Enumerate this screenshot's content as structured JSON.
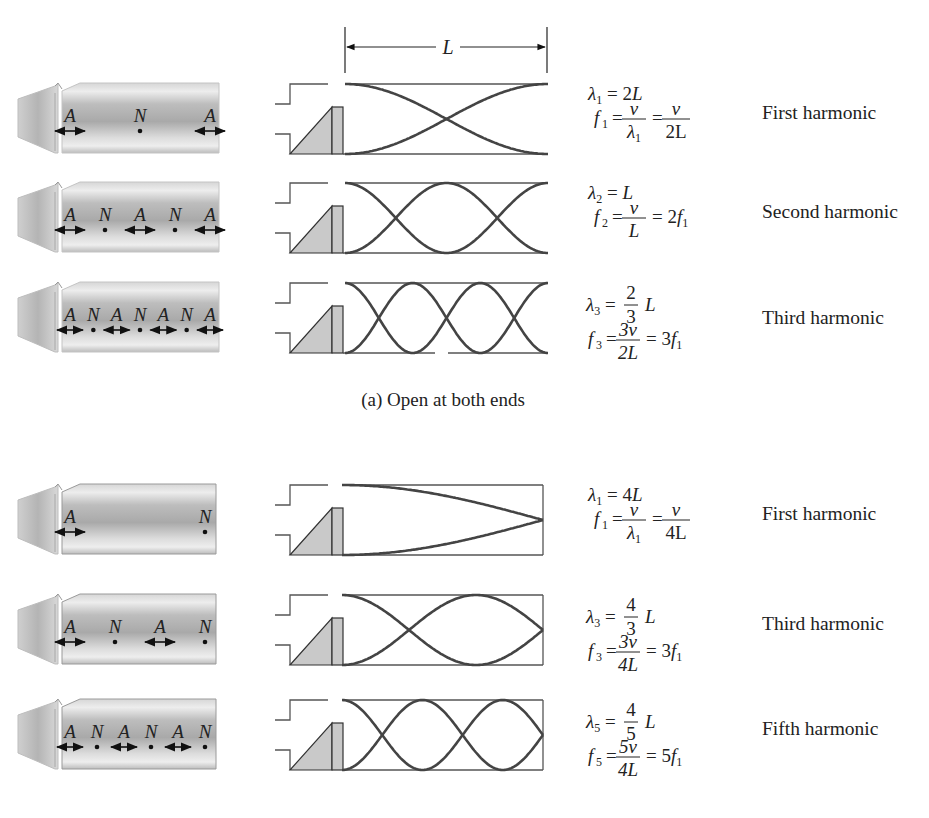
{
  "figure": {
    "dimension_label": "L",
    "colors": {
      "wave_line": "#444444",
      "box_line": "#555555",
      "shade_fill": "#c9c9c9",
      "pipe_light": "#e6e6e6",
      "pipe_dark": "#a8a8a8",
      "text": "#222222"
    }
  },
  "sections": [
    {
      "id": "open-both-ends",
      "caption": "(a) Open at both ends",
      "rows": [
        {
          "harmonic_name": "First harmonic",
          "pipe_markers": [
            "A",
            "N",
            "A"
          ],
          "wavelength": {
            "symbol": "λ",
            "sub": "1",
            "rhs": "= 2L"
          },
          "frequency": {
            "symbol": "f",
            "sub": "1",
            "frac1_num": "v",
            "frac1_den": "λ",
            "frac1_den_sub": "1",
            "frac2_num": "v",
            "frac2_den": "2L"
          },
          "wave": {
            "type": "open",
            "half_waves": 1
          }
        },
        {
          "harmonic_name": "Second harmonic",
          "pipe_markers": [
            "A",
            "N",
            "A",
            "N",
            "A"
          ],
          "wavelength": {
            "symbol": "λ",
            "sub": "2",
            "rhs": "= L"
          },
          "frequency": {
            "symbol": "f",
            "sub": "2",
            "frac1_num": "v",
            "frac1_den": "L",
            "rhs": "= 2f",
            "rhs_sub": "1"
          },
          "wave": {
            "type": "open",
            "half_waves": 2
          }
        },
        {
          "harmonic_name": "Third harmonic",
          "pipe_markers": [
            "A",
            "N",
            "A",
            "N",
            "A",
            "N",
            "A"
          ],
          "wavelength": {
            "symbol": "λ",
            "sub": "3",
            "frac_num": "2",
            "frac_den": "3",
            "rhs": "L"
          },
          "frequency": {
            "symbol": "f",
            "sub": "3",
            "frac1_num": "3v",
            "frac1_den": "2L",
            "rhs": "= 3f",
            "rhs_sub": "1"
          },
          "wave": {
            "type": "open",
            "half_waves": 3
          }
        }
      ]
    },
    {
      "id": "closed-one-end",
      "caption": "",
      "rows": [
        {
          "harmonic_name": "First harmonic",
          "pipe_markers": [
            "A",
            "N"
          ],
          "wavelength": {
            "symbol": "λ",
            "sub": "1",
            "rhs": "= 4L"
          },
          "frequency": {
            "symbol": "f",
            "sub": "1",
            "frac1_num": "v",
            "frac1_den": "λ",
            "frac1_den_sub": "1",
            "frac2_num": "v",
            "frac2_den": "4L"
          },
          "wave": {
            "type": "closed",
            "quarter_waves": 1
          }
        },
        {
          "harmonic_name": "Third harmonic",
          "pipe_markers": [
            "A",
            "N",
            "A",
            "N"
          ],
          "wavelength": {
            "symbol": "λ",
            "sub": "3",
            "frac_num": "4",
            "frac_den": "3",
            "rhs": "L"
          },
          "frequency": {
            "symbol": "f",
            "sub": "3",
            "frac1_num": "3v",
            "frac1_den": "4L",
            "rhs": "= 3f",
            "rhs_sub": "1"
          },
          "wave": {
            "type": "closed",
            "quarter_waves": 3
          }
        },
        {
          "harmonic_name": "Fifth harmonic",
          "pipe_markers": [
            "A",
            "N",
            "A",
            "N",
            "A",
            "N"
          ],
          "wavelength": {
            "symbol": "λ",
            "sub": "5",
            "frac_num": "4",
            "frac_den": "5",
            "rhs": "L"
          },
          "frequency": {
            "symbol": "f",
            "sub": "5",
            "frac1_num": "5v",
            "frac1_den": "4L",
            "rhs": "= 5f",
            "rhs_sub": "1"
          },
          "wave": {
            "type": "closed",
            "quarter_waves": 5
          }
        }
      ]
    }
  ]
}
